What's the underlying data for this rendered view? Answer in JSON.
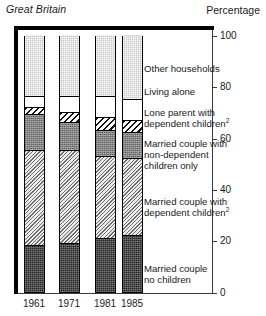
{
  "header": {
    "region": "Great Britain",
    "axis_note": "Percentage"
  },
  "chart_data": {
    "type": "bar",
    "stacked": true,
    "title": "Great Britain",
    "xlabel": "",
    "ylabel": "Percentage",
    "ylim": [
      0,
      100
    ],
    "yticks": [
      0,
      20,
      40,
      60,
      80,
      100
    ],
    "grid": false,
    "legend_position": "right-inline",
    "categories": [
      "1961",
      "1971",
      "1981",
      "1985"
    ],
    "series": [
      {
        "name": "Married couple no children",
        "values": [
          18,
          19,
          21,
          22
        ]
      },
      {
        "name": "Married couple with dependent children",
        "values": [
          37,
          36,
          32,
          30
        ]
      },
      {
        "name": "Married couple with non-dependent children only",
        "values": [
          14,
          11,
          10,
          10
        ]
      },
      {
        "name": "Lone parent with dependent children",
        "values": [
          3,
          4,
          5,
          5
        ]
      },
      {
        "name": "Living alone",
        "values": [
          4,
          6,
          8,
          8
        ]
      },
      {
        "name": "Other households",
        "values": [
          24,
          24,
          24,
          25
        ]
      }
    ]
  },
  "yaxis": {
    "labels": [
      "100",
      "80",
      "60",
      "40",
      "20",
      "0"
    ]
  },
  "xaxis": {
    "labels": [
      "1961",
      "1971",
      "1981",
      "1985"
    ]
  },
  "legend": {
    "items": [
      {
        "key": "other",
        "label": "Other households"
      },
      {
        "key": "alone",
        "label": "Living alone"
      },
      {
        "key": "lone",
        "label": "Lone parent with\ndependent children",
        "note": "2"
      },
      {
        "key": "nondep",
        "label": "Married couple with\nnon-dependent\nchildren only"
      },
      {
        "key": "dep",
        "label": "Married couple with\ndependent children",
        "note": "2"
      },
      {
        "key": "nokids",
        "label": "Married couple\nno children"
      }
    ]
  },
  "colors": {
    "other": "#c9c9c9",
    "alone": "#ffffff",
    "lone": "#111111",
    "nondep": "#838383",
    "dep": "#6d6d6d",
    "nokids": "#262626",
    "frame": "#000000",
    "axis": "#3b3b3b"
  }
}
